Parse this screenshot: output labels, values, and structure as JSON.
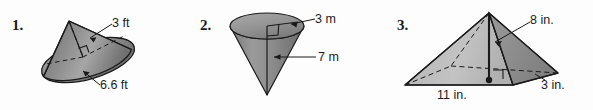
{
  "page": {
    "kind": "geometry-exercise-row",
    "background": "#fdfdfd",
    "ink": "#1c1c1c"
  },
  "problems": [
    {
      "number": "1.",
      "solid": "cone-tilted",
      "labels": [
        {
          "name": "radius",
          "text": "3 ft"
        },
        {
          "name": "slant-height",
          "text": "6.6 ft"
        }
      ],
      "colors": {
        "light": "#b9b9b9",
        "mid": "#9a9a9a",
        "dark": "#6f6f6f",
        "edge": "#1a1a1a"
      }
    },
    {
      "number": "2.",
      "solid": "cone-inverted",
      "labels": [
        {
          "name": "radius",
          "text": "3 m"
        },
        {
          "name": "height",
          "text": "7 m"
        }
      ],
      "colors": {
        "light": "#b9b9b9",
        "mid": "#9a9a9a",
        "dark": "#6f6f6f",
        "edge": "#1a1a1a"
      }
    },
    {
      "number": "3.",
      "solid": "rectangular-pyramid",
      "labels": [
        {
          "name": "height",
          "text": "8 in."
        },
        {
          "name": "base-depth",
          "text": "3 in."
        },
        {
          "name": "base-width",
          "text": "11 in."
        }
      ],
      "colors": {
        "light": "#c2c2c2",
        "mid": "#a8a8a8",
        "dark": "#8a8a8a",
        "edge": "#1a1a1a"
      }
    }
  ]
}
